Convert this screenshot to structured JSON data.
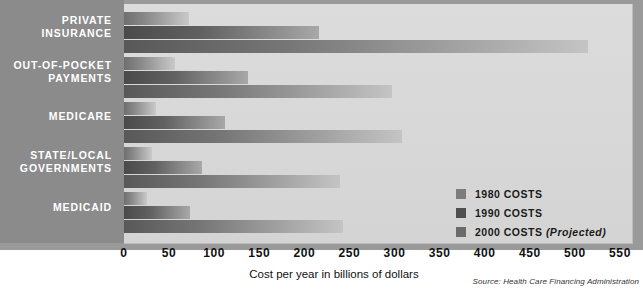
{
  "chart_data": {
    "type": "bar",
    "orientation": "horizontal",
    "title": "",
    "xlabel": "Cost per year in billions of dollars",
    "ylabel": "",
    "xlim": [
      0,
      550
    ],
    "xticks": [
      0,
      50,
      100,
      150,
      200,
      250,
      300,
      350,
      400,
      450,
      500,
      550
    ],
    "xtick_labels": [
      "0",
      "50",
      "100",
      "150",
      "200",
      "250",
      "300",
      "350",
      "400",
      "450",
      "500",
      "550"
    ],
    "grid": false,
    "legend_position": "inside-lower-right",
    "categories": [
      "PRIVATE INSURANCE",
      "OUT-OF-POCKET PAYMENTS",
      "MEDICARE",
      "STATE/LOCAL GOVERNMENTS",
      "MEDICAID"
    ],
    "series": [
      {
        "name": "1980 COSTS",
        "color": "#7d7d7d",
        "values": [
          72,
          57,
          36,
          31,
          26
        ]
      },
      {
        "name": "1990 COSTS",
        "color": "#4f4f4f",
        "values": [
          216,
          137,
          112,
          87,
          73
        ]
      },
      {
        "name": "2000 COSTS",
        "color": "#6b6b6b",
        "values": [
          514,
          297,
          308,
          240,
          243
        ]
      }
    ],
    "annotations": {
      "source": "Source: Health Care Financing Administration"
    }
  },
  "legend": {
    "items": [
      {
        "label": "1980 COSTS",
        "suffix": ""
      },
      {
        "label": "1990 COSTS",
        "suffix": ""
      },
      {
        "label": "2000 COSTS",
        "suffix": "(Projected)"
      }
    ]
  },
  "axis": {
    "title": "Cost per year in billions of dollars",
    "ticks": [
      "0",
      "50",
      "100",
      "150",
      "200",
      "250",
      "300",
      "350",
      "400",
      "450",
      "500",
      "550"
    ]
  },
  "categories": {
    "private_insurance_line1": "PRIVATE",
    "private_insurance_line2": "INSURANCE",
    "out_of_pocket_line1": "OUT-OF-POCKET",
    "out_of_pocket_line2": "PAYMENTS",
    "medicare": "MEDICARE",
    "state_local_line1": "STATE/LOCAL",
    "state_local_line2": "GOVERNMENTS",
    "medicaid": "MEDICAID"
  },
  "source_note": "Source: Health Care Financing Administration",
  "colors": {
    "panel": "#8b8b8b",
    "plot_field": "#d9d9d9",
    "frame": "#9a9a9a",
    "bar_1980": "#7d7d7d",
    "bar_1990": "#4f4f4f",
    "bar_2000": "#6b6b6b"
  }
}
